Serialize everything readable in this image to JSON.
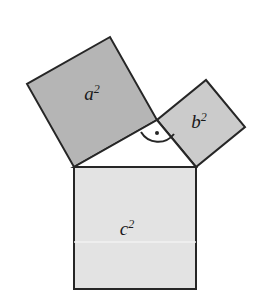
{
  "figure": {
    "name": "pythagorean-theorem-diagram",
    "background_color": "#ffffff",
    "stroke_color": "#262626",
    "stroke_width": 2
  },
  "squares": [
    {
      "id": "square-a",
      "label_base": "a",
      "label_exponent": "2",
      "fill_color": "#b5b5b5",
      "label_x": 92,
      "label_y": 100,
      "points": "74,167 157,120 110,37 27,84"
    },
    {
      "id": "square-b",
      "label_base": "b",
      "label_exponent": "2",
      "fill_color": "#cbcbcb",
      "label_x": 199,
      "label_y": 128,
      "points": "157,120 196,167 245,127 206,80"
    },
    {
      "id": "square-c",
      "label_base": "c",
      "label_exponent": "2",
      "fill_color": "#e3e3e3",
      "label_x": 127,
      "label_y": 235,
      "points": "74,167 196,167 196,289 74,289"
    }
  ],
  "triangle": {
    "id": "right-triangle",
    "fill_color": "#ffffff",
    "points": "74,167 196,167 157,120",
    "vertex_right_angle_x": 157,
    "vertex_right_angle_y": 120
  },
  "right_angle_marker": {
    "id": "right-angle-marker",
    "arc_path": "M 141 132 A 20 20 0 0 0 174 134",
    "dot_x": 157,
    "dot_y": 133,
    "dot_radius": 2,
    "color": "#262626"
  },
  "seam_line": {
    "id": "c-square-seam",
    "x1": 74,
    "y1": 242,
    "x2": 196,
    "y2": 242,
    "color": "#f2f2f2"
  }
}
